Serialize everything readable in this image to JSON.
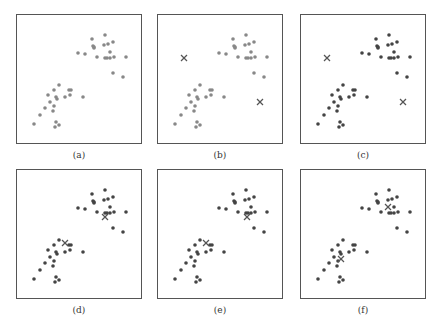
{
  "figure": {
    "colors": {
      "unassigned_point": "#888888",
      "assigned_point": "#444444",
      "centroid": "#555555",
      "border": "#555555"
    },
    "points": [
      [
        75,
        24
      ],
      [
        88,
        20
      ],
      [
        76,
        31
      ],
      [
        77,
        32
      ],
      [
        77,
        33
      ],
      [
        87,
        30
      ],
      [
        91,
        29
      ],
      [
        96,
        27
      ],
      [
        61,
        38
      ],
      [
        68,
        39
      ],
      [
        80,
        42
      ],
      [
        93,
        37
      ],
      [
        88,
        43
      ],
      [
        90,
        43
      ],
      [
        93,
        43
      ],
      [
        97,
        42
      ],
      [
        109,
        42
      ],
      [
        96,
        58
      ],
      [
        106,
        62
      ],
      [
        42,
        70
      ],
      [
        37,
        75
      ],
      [
        52,
        75
      ],
      [
        54,
        75
      ],
      [
        31,
        80
      ],
      [
        39,
        82
      ],
      [
        40,
        84
      ],
      [
        48,
        82
      ],
      [
        53,
        80
      ],
      [
        66,
        82
      ],
      [
        33,
        87
      ],
      [
        37,
        91
      ],
      [
        28,
        93
      ],
      [
        36,
        96
      ],
      [
        23,
        100
      ],
      [
        17,
        109
      ],
      [
        39,
        107
      ],
      [
        42,
        110
      ],
      [
        38,
        112
      ]
    ],
    "panels": [
      {
        "id": "a",
        "label": "(a)",
        "x": 16,
        "y": 14,
        "assigned": false,
        "centroids": []
      },
      {
        "id": "b",
        "label": "(b)",
        "x": 157,
        "y": 14,
        "assigned": false,
        "centroids": [
          [
            26,
            43
          ],
          [
            102,
            87
          ]
        ]
      },
      {
        "id": "c",
        "label": "(c)",
        "x": 300,
        "y": 14,
        "assigned": true,
        "centroids": [
          [
            26,
            43
          ],
          [
            102,
            87
          ]
        ]
      },
      {
        "id": "d",
        "label": "(d)",
        "x": 16,
        "y": 169,
        "assigned": true,
        "centroids": [
          [
            48,
            73
          ],
          [
            88,
            47
          ]
        ]
      },
      {
        "id": "e",
        "label": "(e)",
        "x": 157,
        "y": 169,
        "assigned": true,
        "centroids": [
          [
            48,
            73
          ],
          [
            89,
            47
          ]
        ]
      },
      {
        "id": "f",
        "label": "(f)",
        "x": 300,
        "y": 169,
        "assigned": true,
        "centroids": [
          [
            40,
            89
          ],
          [
            87,
            37
          ]
        ]
      }
    ]
  },
  "labels": {
    "a": "(a)",
    "b": "(b)",
    "c": "(c)",
    "d": "(d)",
    "e": "(e)",
    "f": "(f)"
  }
}
